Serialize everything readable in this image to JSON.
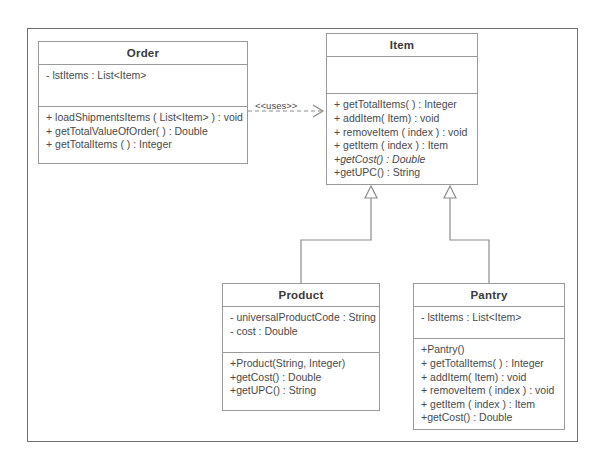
{
  "diagram": {
    "type": "uml-class-diagram",
    "classes": [
      {
        "id": "order",
        "name": "Order",
        "attributes": [
          "- lstItems : List<Item>"
        ],
        "methods": [
          {
            "text": "+ loadShipmentsItems ( List<Item> ) : void",
            "abstract": false
          },
          {
            "text": "+ getTotalValueOfOrder( ) : Double",
            "abstract": false
          },
          {
            "text": "+ getTotalItems ( ) : Integer",
            "abstract": false
          }
        ]
      },
      {
        "id": "item",
        "name": "Item",
        "attributes": [],
        "methods": [
          {
            "text": "+ getTotalItems( ) : Integer",
            "abstract": false
          },
          {
            "text": "+ addItem( Item) : void",
            "abstract": false
          },
          {
            "text": "+ removeItem ( index ) : void",
            "abstract": false
          },
          {
            "text": "+ getItem ( index ) : Item",
            "abstract": false
          },
          {
            "text": "+getCost() : Double",
            "abstract": true
          },
          {
            "text": "+getUPC() : String",
            "abstract": false
          }
        ]
      },
      {
        "id": "product",
        "name": "Product",
        "attributes": [
          "- universalProductCode  : String",
          "- cost : Double"
        ],
        "methods": [
          {
            "text": "+Product(String, Integer)",
            "abstract": false
          },
          {
            "text": "+getCost() : Double",
            "abstract": false
          },
          {
            "text": "+getUPC() : String",
            "abstract": false
          }
        ]
      },
      {
        "id": "pantry",
        "name": "Pantry",
        "attributes": [
          "- lstItems : List<Item>"
        ],
        "methods": [
          {
            "text": "+Pantry()",
            "abstract": false
          },
          {
            "text": "+ getTotalItems( ) : Integer",
            "abstract": false
          },
          {
            "text": "+ addItem( Item) : void",
            "abstract": false
          },
          {
            "text": "+ removeItem ( index ) : void",
            "abstract": false
          },
          {
            "text": "+ getItem ( index ) : Item",
            "abstract": false
          },
          {
            "text": "+getCost() : Double",
            "abstract": false
          }
        ]
      }
    ],
    "relationships": [
      {
        "id": "order-uses-item",
        "kind": "dependency",
        "label": "<<uses>>",
        "from": "Order",
        "to": "Item"
      },
      {
        "id": "product-extends-item",
        "kind": "generalization",
        "label": "",
        "from": "Product",
        "to": "Item"
      },
      {
        "id": "pantry-extends-item",
        "kind": "generalization",
        "label": "",
        "from": "Pantry",
        "to": "Item"
      }
    ],
    "colors": {
      "frame_border": "#6f6f6f",
      "class_border": "#9a9a9a",
      "connector": "#8c8c8c",
      "text": "#4a4a4a",
      "title_text": "#3a3a3a",
      "background": "#ffffff"
    }
  }
}
